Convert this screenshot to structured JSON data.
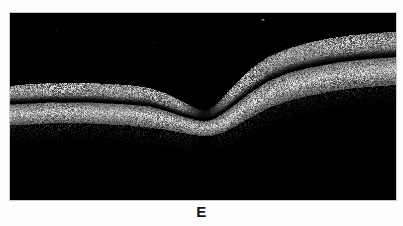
{
  "figure": {
    "panel_letter": "E",
    "modality_label": "oct-b-scan",
    "background_color": "#fdfdfd",
    "frame_border_color": "#c9c9c9",
    "scan_background_color": "#000000"
  },
  "scan": {
    "frame": {
      "x": 9,
      "y": 12,
      "width": 388,
      "height": 189
    },
    "description": "optical-coherence-tomography-macular-b-scan",
    "tissue_color_bright": "#e8e8e8",
    "tissue_color_mid": "#a8a8a8",
    "tissue_color_dim": "#5a5a5a",
    "features": [
      {
        "name": "foveal-depression",
        "x": 196,
        "y": 105
      },
      {
        "name": "nerve-fiber-band-left",
        "x": 60,
        "y": 92
      },
      {
        "name": "rpe-band-left",
        "x": 60,
        "y": 118
      },
      {
        "name": "nerve-fiber-band-right",
        "x": 320,
        "y": 52
      },
      {
        "name": "rpe-band-right",
        "x": 320,
        "y": 88
      },
      {
        "name": "posterior-shadow-streak",
        "x": 198,
        "y": 160
      },
      {
        "name": "noise-speck",
        "x": 262,
        "y": 18
      }
    ],
    "chart_data": {
      "type": "line",
      "title": "Retinal layer contours (OCT B-scan, panel E)",
      "xlabel": "lateral position (px)",
      "ylabel": "depth (px)",
      "xlim": [
        0,
        388
      ],
      "ylim": [
        0,
        189
      ],
      "grid": false,
      "legend_position": "none",
      "x": [
        0,
        20,
        40,
        60,
        80,
        100,
        120,
        140,
        155,
        170,
        180,
        188,
        196,
        204,
        214,
        226,
        240,
        260,
        280,
        300,
        320,
        340,
        360,
        388
      ],
      "series": [
        {
          "name": "inner-retinal-surface",
          "values": [
            74,
            72,
            71,
            71,
            71,
            72,
            73,
            76,
            81,
            88,
            93,
            97,
            99,
            95,
            85,
            72,
            58,
            44,
            36,
            30,
            26,
            23,
            21,
            19
          ]
        },
        {
          "name": "outer-plexiform-boundary",
          "values": [
            92,
            91,
            90,
            90,
            90,
            91,
            92,
            94,
            98,
            103,
            106,
            108,
            109,
            107,
            101,
            92,
            81,
            68,
            60,
            55,
            51,
            48,
            46,
            44
          ]
        },
        {
          "name": "rpe-band",
          "values": [
            110,
            109,
            108,
            108,
            108,
            109,
            110,
            112,
            114,
            117,
            119,
            120,
            121,
            120,
            117,
            111,
            103,
            92,
            85,
            80,
            76,
            73,
            71,
            69
          ]
        }
      ]
    }
  }
}
